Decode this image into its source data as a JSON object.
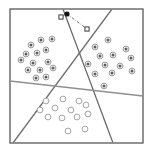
{
  "figure": {
    "title": "",
    "caption": "",
    "background_color": "#ffffff"
  },
  "frame": {
    "name": "plot-frame",
    "x": 10,
    "y": 9,
    "width": 133,
    "height": 134,
    "stroke_color": "#4a4a4a",
    "stroke_width": 1.2,
    "fill_color": "#ffffff"
  },
  "chart_data": {
    "type": "scatter",
    "title": "",
    "xlabel": "",
    "ylabel": "",
    "xlim": [
      10,
      143
    ],
    "ylim": [
      9,
      143
    ],
    "grid": false,
    "legend_position": "none",
    "axis_ticks": false,
    "series": [
      {
        "name": "class-a-left-cluster",
        "marker": "filled-ring-dot",
        "marker_fill": "#5a5a5a",
        "marker_ring": "#8d8d8d",
        "marker_radius": 2.9,
        "count": 14,
        "points": [
          [
            41,
            40
          ],
          [
            31,
            45
          ],
          [
            52,
            39
          ],
          [
            26,
            54
          ],
          [
            37,
            53
          ],
          [
            46,
            50
          ],
          [
            21,
            60
          ],
          [
            33,
            63
          ],
          [
            48,
            62
          ],
          [
            28,
            70
          ],
          [
            40,
            70
          ],
          [
            53,
            68
          ],
          [
            36,
            78
          ],
          [
            46,
            77
          ]
        ]
      },
      {
        "name": "class-b-right-cluster",
        "marker": "filled-ring-dot",
        "marker_fill": "#5a5a5a",
        "marker_ring": "#8d8d8d",
        "marker_radius": 2.9,
        "count": 13,
        "points": [
          [
            108,
            40
          ],
          [
            95,
            47
          ],
          [
            126,
            49
          ],
          [
            100,
            56
          ],
          [
            113,
            55
          ],
          [
            131,
            58
          ],
          [
            88,
            64
          ],
          [
            105,
            65
          ],
          [
            120,
            66
          ],
          [
            95,
            74
          ],
          [
            112,
            73
          ],
          [
            132,
            71
          ],
          [
            104,
            86
          ]
        ]
      },
      {
        "name": "class-c-bottom-cluster",
        "marker": "hollow-ring-dot",
        "marker_fill": "#ffffff",
        "marker_ring": "#9a9a9a",
        "marker_radius": 2.9,
        "count": 13,
        "points": [
          [
            46,
            101
          ],
          [
            63,
            99
          ],
          [
            79,
            101
          ],
          [
            40,
            110
          ],
          [
            55,
            108
          ],
          [
            71,
            110
          ],
          [
            86,
            105
          ],
          [
            48,
            117
          ],
          [
            62,
            118
          ],
          [
            77,
            117
          ],
          [
            88,
            114
          ],
          [
            68,
            131
          ],
          [
            85,
            129
          ]
        ]
      },
      {
        "name": "query-point",
        "marker": "solid-dot",
        "marker_fill": "#111111",
        "marker_radius": 2.6,
        "count": 1,
        "points": [
          [
            67,
            14
          ]
        ]
      },
      {
        "name": "prototype-markers",
        "marker": "open-square",
        "marker_fill": "#ffffff",
        "marker_ring": "#3a3a3a",
        "marker_size": 4.2,
        "count": 2,
        "points": [
          [
            61,
            17
          ],
          [
            87,
            29
          ]
        ]
      }
    ],
    "connector": {
      "name": "query-to-prototype-link",
      "style": "dash-dot",
      "color": "#555555",
      "stroke_width": 0.8,
      "path": [
        [
          61,
          17
        ],
        [
          67,
          14
        ],
        [
          87,
          29
        ]
      ]
    },
    "decision_boundaries": [
      {
        "name": "boundary-line-1",
        "label": "steep-left-to-bottom",
        "color": "#6b6b6b",
        "stroke_width": 1.3,
        "x1": 63,
        "y1": 9,
        "x2": 113,
        "y2": 143
      },
      {
        "name": "boundary-line-2",
        "label": "steep-right-to-bottom-left",
        "color": "#6b6b6b",
        "stroke_width": 1.3,
        "x1": 112,
        "y1": 9,
        "x2": 13,
        "y2": 143
      },
      {
        "name": "boundary-line-3",
        "label": "near-horizontal-separator",
        "color": "#8f8f8f",
        "stroke_width": 1.4,
        "x1": 10,
        "y1": 81,
        "x2": 143,
        "y2": 96
      }
    ]
  }
}
